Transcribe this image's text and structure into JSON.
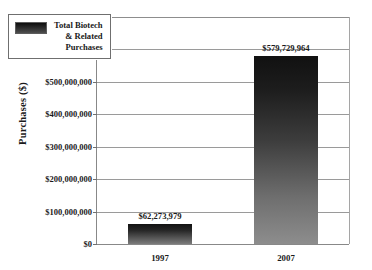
{
  "chart_data": {
    "type": "bar",
    "title": "",
    "xlabel": "",
    "ylabel": "Purchases ($)",
    "categories": [
      "1997",
      "2007"
    ],
    "values": [
      62273979,
      579729964
    ],
    "value_labels": [
      "$62,273,979",
      "$579,729,964"
    ],
    "series": [
      {
        "name": "Total Biotech\n& Related\nPurchases",
        "values": [
          62273979,
          579729964
        ]
      }
    ],
    "ylim": [
      0,
      700000000
    ],
    "ytick_values": [
      0,
      100000000,
      200000000,
      300000000,
      400000000,
      500000000,
      600000000,
      700000000
    ],
    "ytick_labels": [
      "$0",
      "$100,000,000",
      "$200,000,000",
      "$300,000,000",
      "$400,000,000",
      "$500,000,000",
      "$600,000,000",
      "$700,000,000"
    ],
    "grid": "horizontal",
    "legend_position": "upper-left-inside",
    "bar_color_top": "#111111",
    "bar_color_bottom": "#8d8d8d",
    "gridline_color": "#9a9a9a",
    "axis_color": "#888888"
  },
  "legend": {
    "label": "Total Biotech\n& Related\nPurchases"
  },
  "artifact": {
    "top_text": ""
  }
}
